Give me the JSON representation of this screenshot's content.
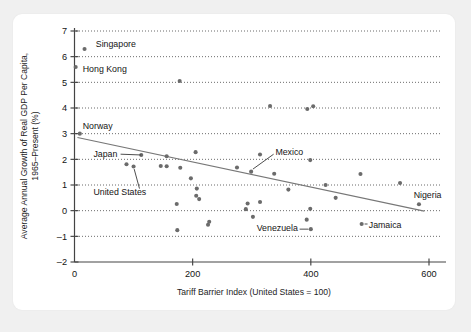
{
  "figure": {
    "background_color": "#f0f0f0",
    "card_color": "#ffffff",
    "point_color": "#6b6b6b",
    "trend_color": "#777777"
  },
  "chart_data": {
    "type": "scatter",
    "title": "",
    "xlabel": "Tariff Barrier Index (United States = 100)",
    "ylabel": "Average Annual Growth of Real GDP Per Capita, 1965–Present (%)",
    "xlim": [
      0,
      620
    ],
    "ylim": [
      -2,
      7
    ],
    "xticks": [
      0,
      200,
      400,
      600
    ],
    "xtick_labels": [
      "0",
      "200",
      "400",
      "600"
    ],
    "yticks": [
      -2,
      -1,
      0,
      1,
      2,
      3,
      4,
      5,
      6,
      7
    ],
    "ytick_labels": [
      "–2",
      "–1",
      "0",
      "1",
      "2",
      "3",
      "4",
      "5",
      "6",
      "7"
    ],
    "grid": "horizontal-dotted",
    "legend": "none",
    "points": [
      {
        "x": 17,
        "y": 6.3,
        "label": "Singapore"
      },
      {
        "x": 2,
        "y": 5.6,
        "label": "Hong Kong"
      },
      {
        "x": 178,
        "y": 5.05,
        "label": ""
      },
      {
        "x": 331,
        "y": 4.08,
        "label": ""
      },
      {
        "x": 394,
        "y": 3.96,
        "label": ""
      },
      {
        "x": 404,
        "y": 4.07,
        "label": ""
      },
      {
        "x": 9,
        "y": 3.0,
        "label": "Norway"
      },
      {
        "x": 113,
        "y": 2.17,
        "label": "Japan"
      },
      {
        "x": 156,
        "y": 2.12,
        "label": ""
      },
      {
        "x": 205,
        "y": 2.28,
        "label": ""
      },
      {
        "x": 314,
        "y": 2.19,
        "label": ""
      },
      {
        "x": 399,
        "y": 1.97,
        "label": ""
      },
      {
        "x": 88,
        "y": 1.81,
        "label": ""
      },
      {
        "x": 100,
        "y": 1.72,
        "label": "United States"
      },
      {
        "x": 146,
        "y": 1.74,
        "label": ""
      },
      {
        "x": 156,
        "y": 1.73,
        "label": ""
      },
      {
        "x": 179,
        "y": 1.67,
        "label": ""
      },
      {
        "x": 275,
        "y": 1.68,
        "label": ""
      },
      {
        "x": 299,
        "y": 1.52,
        "label": "Mexico"
      },
      {
        "x": 338,
        "y": 1.44,
        "label": ""
      },
      {
        "x": 484,
        "y": 1.43,
        "label": ""
      },
      {
        "x": 197,
        "y": 1.26,
        "label": ""
      },
      {
        "x": 551,
        "y": 1.08,
        "label": ""
      },
      {
        "x": 425,
        "y": 1.0,
        "label": ""
      },
      {
        "x": 207,
        "y": 0.86,
        "label": ""
      },
      {
        "x": 362,
        "y": 0.82,
        "label": ""
      },
      {
        "x": 206,
        "y": 0.58,
        "label": ""
      },
      {
        "x": 211,
        "y": 0.45,
        "label": ""
      },
      {
        "x": 442,
        "y": 0.5,
        "label": ""
      },
      {
        "x": 314,
        "y": 0.34,
        "label": ""
      },
      {
        "x": 293,
        "y": 0.28,
        "label": ""
      },
      {
        "x": 173,
        "y": 0.26,
        "label": ""
      },
      {
        "x": 583,
        "y": 0.25,
        "label": "Nigeria"
      },
      {
        "x": 290,
        "y": 0.06,
        "label": ""
      },
      {
        "x": 399,
        "y": 0.07,
        "label": ""
      },
      {
        "x": 302,
        "y": -0.24,
        "label": ""
      },
      {
        "x": 393,
        "y": -0.35,
        "label": ""
      },
      {
        "x": 228,
        "y": -0.43,
        "label": ""
      },
      {
        "x": 226,
        "y": -0.55,
        "label": ""
      },
      {
        "x": 486,
        "y": -0.52,
        "label": "Jamaica"
      },
      {
        "x": 400,
        "y": -0.72,
        "label": "Venezuela"
      },
      {
        "x": 174,
        "y": -0.76,
        "label": ""
      }
    ],
    "trend_line": {
      "x_start": 5,
      "y_start": 2.85,
      "x_end": 592,
      "y_end": -0.02
    },
    "annotations": [
      {
        "text": "Singapore",
        "x": 36,
        "y": 6.52,
        "anchor": "start"
      },
      {
        "text": "Hong Kong",
        "x": 14,
        "y": 5.52,
        "anchor": "start"
      },
      {
        "text": "Norway",
        "x": 14,
        "y": 3.32,
        "anchor": "start"
      },
      {
        "text": "Japan",
        "x": 32,
        "y": 2.23,
        "anchor": "start"
      },
      {
        "text": "United States",
        "x": 32,
        "y": 0.72,
        "anchor": "start"
      },
      {
        "text": "Mexico",
        "x": 340,
        "y": 2.28,
        "anchor": "start"
      },
      {
        "text": "Venezuela",
        "x": 378,
        "y": -0.68,
        "anchor": "end"
      },
      {
        "text": "Jamaica",
        "x": 498,
        "y": -0.55,
        "anchor": "start"
      },
      {
        "text": "Nigeria",
        "x": 574,
        "y": 0.62,
        "anchor": "start"
      }
    ]
  }
}
